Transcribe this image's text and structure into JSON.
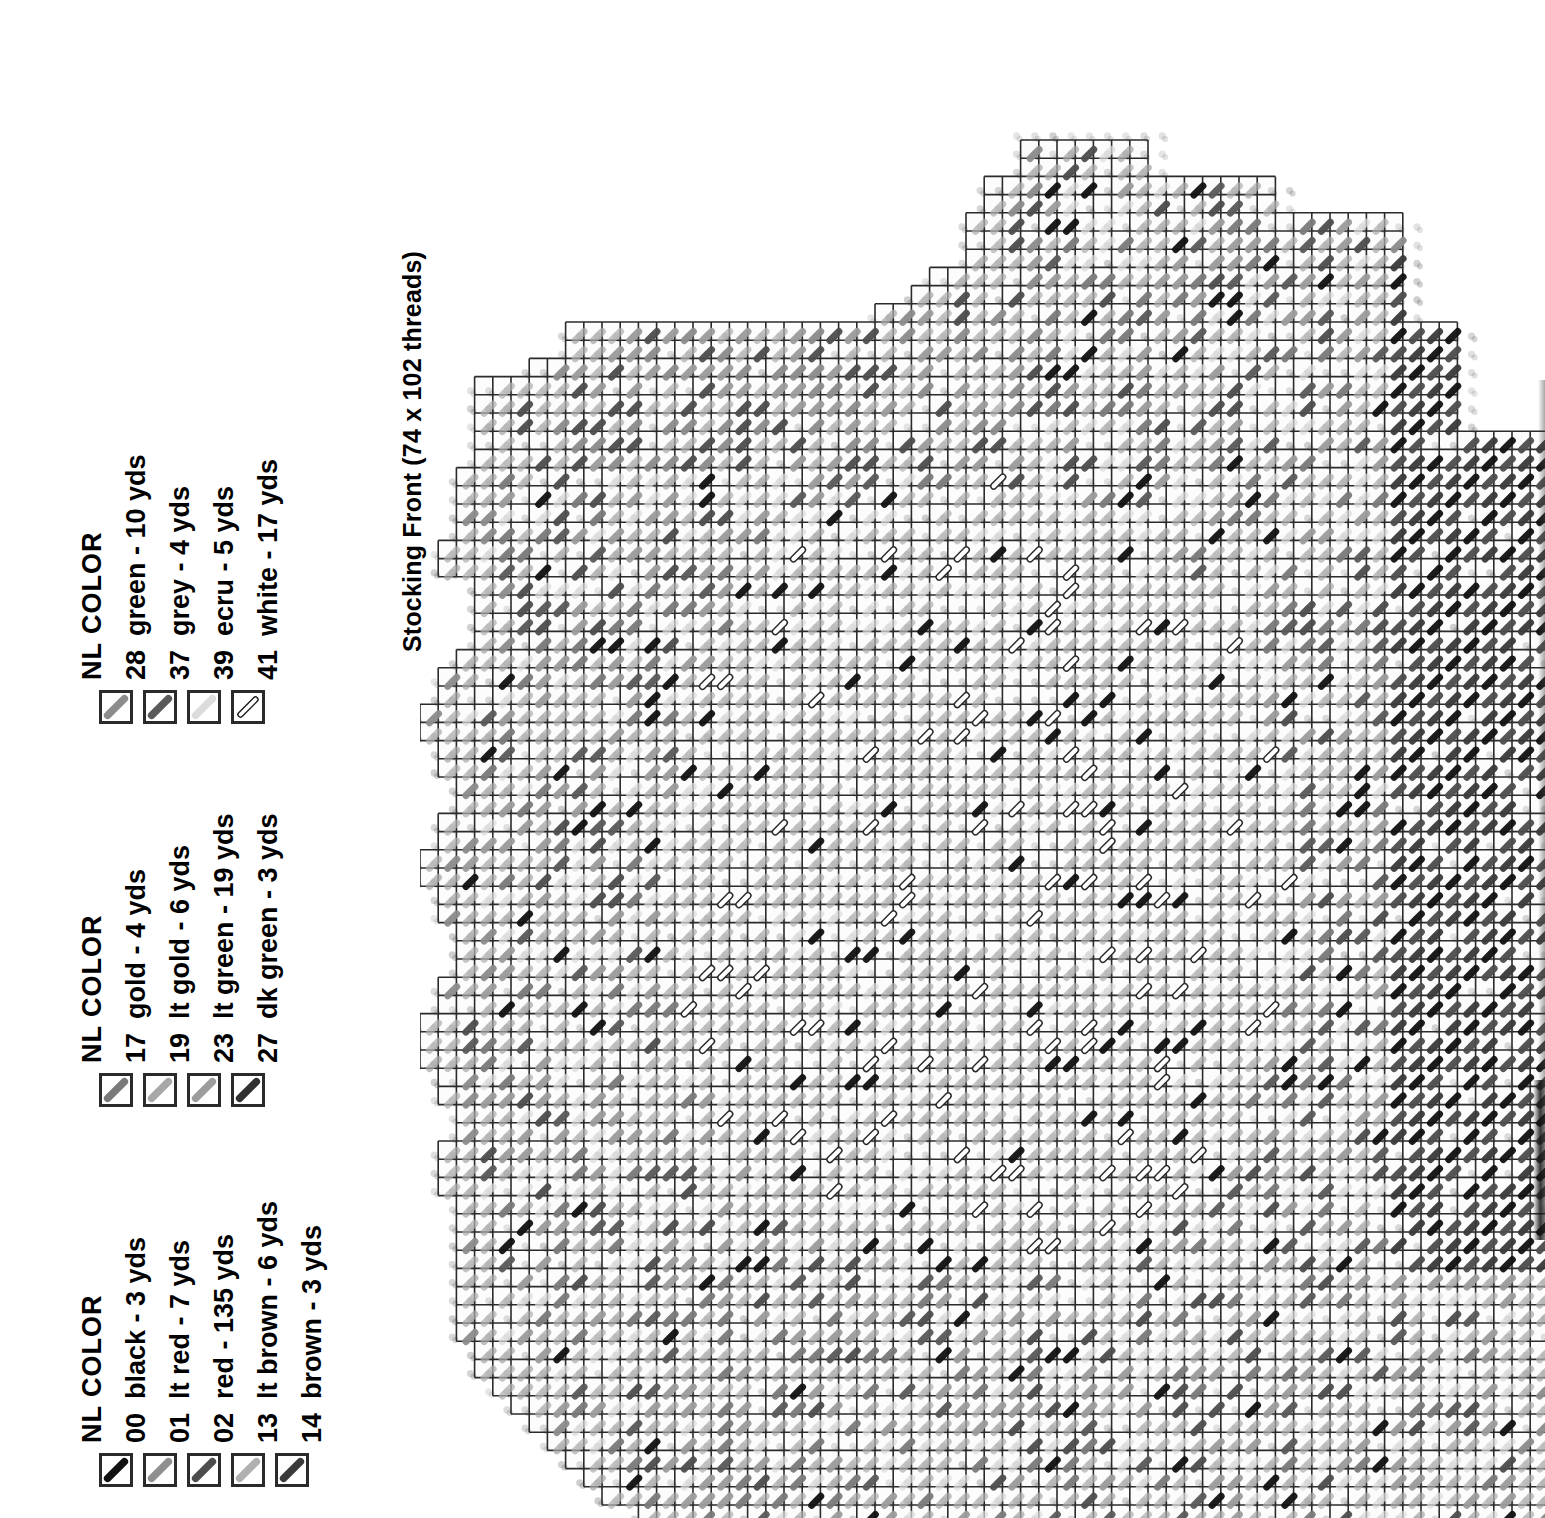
{
  "chart_title": "Stocking Front (74 x 102 threads)",
  "legend": {
    "header_nl": "NL",
    "header_color": "COLOR",
    "columns": [
      {
        "header": "NL  COLOR",
        "rows": [
          {
            "nl": "00",
            "label": "black - 3 yds",
            "color": "#111111",
            "style": "solid"
          },
          {
            "nl": "01",
            "label": "lt red - 7 yds",
            "color": "#8f8f8f",
            "style": "solid"
          },
          {
            "nl": "02",
            "label": "red - 135 yds",
            "color": "#4d4d4d",
            "style": "solid"
          },
          {
            "nl": "13",
            "label": "lt brown - 6 yds",
            "color": "#b0b0b0",
            "style": "solid"
          },
          {
            "nl": "14",
            "label": "brown - 3 yds",
            "color": "#3a3a3a",
            "style": "solid"
          }
        ]
      },
      {
        "header": "NL  COLOR",
        "rows": [
          {
            "nl": "17",
            "label": "gold - 4 yds",
            "color": "#7a7a7a",
            "style": "solid"
          },
          {
            "nl": "19",
            "label": "lt gold - 6 yds",
            "color": "#a8a8a8",
            "style": "solid"
          },
          {
            "nl": "23",
            "label": "lt green - 19 yds",
            "color": "#9c9c9c",
            "style": "solid"
          },
          {
            "nl": "27",
            "label": "dk green - 3 yds",
            "color": "#303030",
            "style": "solid"
          }
        ]
      },
      {
        "header": "NL  COLOR",
        "rows": [
          {
            "nl": "28",
            "label": "green - 10 yds",
            "color": "#8c8c8c",
            "style": "solid"
          },
          {
            "nl": "37",
            "label": "grey - 4 yds",
            "color": "#5a5a5a",
            "style": "solid"
          },
          {
            "nl": "39",
            "label": "ecru - 5 yds",
            "color": "#dcdcdc",
            "style": "solid"
          },
          {
            "nl": "41",
            "label": "white - 17 yds",
            "color": "#ffffff",
            "style": "outline"
          }
        ]
      }
    ]
  },
  "chart_data": {
    "type": "heatmap",
    "title": "Stocking Front (74 x 102 threads)",
    "xlabel": "",
    "ylabel": "",
    "grid": true,
    "legend_position": "left",
    "threads_wide": 74,
    "threads_high": 102,
    "cell_px": 18.2,
    "palette": {
      "black": "#111111",
      "lt red": "#8f8f8f",
      "red": "#4d4d4d",
      "lt brown": "#b0b0b0",
      "brown": "#3a3a3a",
      "gold": "#7a7a7a",
      "lt gold": "#a8a8a8",
      "lt green": "#9c9c9c",
      "dk green": "#303030",
      "green": "#8c8c8c",
      "grey": "#5a5a5a",
      "ecru": "#dcdcdc",
      "white": "#ffffff"
    }
  }
}
